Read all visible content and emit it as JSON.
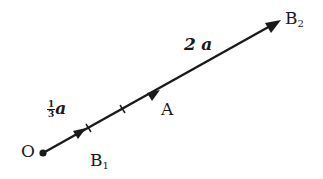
{
  "diagram": {
    "title": "",
    "points": {
      "O": {
        "label": "O"
      },
      "B1": {
        "label": "B",
        "sub": "1"
      },
      "A": {
        "label": "A"
      },
      "B2": {
        "label": "B",
        "sub": "2"
      }
    },
    "vectors": [
      {
        "from": "O",
        "to": "B1",
        "label_num": "1",
        "label_den": "3",
        "label_var": "a"
      },
      {
        "from": "O",
        "to": "A",
        "label": "a"
      },
      {
        "from": "O",
        "to": "B2",
        "label_coef": "2",
        "label_var": "a"
      }
    ],
    "colors": {
      "line": "#1a1a1a",
      "background": "#ffffff"
    }
  }
}
